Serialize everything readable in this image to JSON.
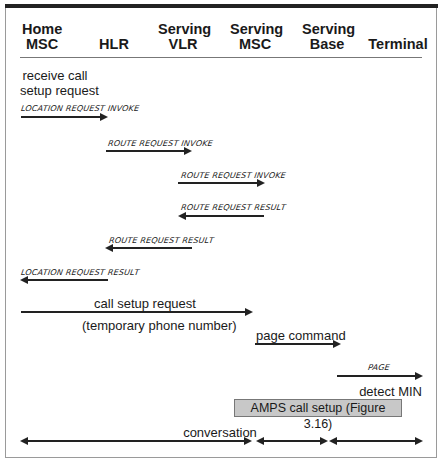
{
  "columns": [
    {
      "name": "home-msc",
      "line1": "Home",
      "line2": "MSC"
    },
    {
      "name": "hlr",
      "line1": "",
      "line2": "HLR"
    },
    {
      "name": "serving-vlr",
      "line1": "Serving",
      "line2": "VLR"
    },
    {
      "name": "serving-msc",
      "line1": "Serving",
      "line2": "MSC"
    },
    {
      "name": "serving-base",
      "line1": "Serving",
      "line2": "Base"
    },
    {
      "name": "terminal",
      "line1": "",
      "line2": "Terminal"
    }
  ],
  "notes": {
    "receive_call_1": "receive call",
    "receive_call_2": "setup request",
    "detect_min": "detect MIN"
  },
  "messages": [
    {
      "label": "LOCATION REQUEST INVOKE",
      "from": "Home MSC",
      "to": "HLR",
      "direction": "right"
    },
    {
      "label": "ROUTE REQUEST INVOKE",
      "from": "HLR",
      "to": "Serving VLR",
      "direction": "right"
    },
    {
      "label": "ROUTE REQUEST INVOKE",
      "from": "Serving VLR",
      "to": "Serving MSC",
      "direction": "right"
    },
    {
      "label": "ROUTE REQUEST RESULT",
      "from": "Serving MSC",
      "to": "Serving VLR",
      "direction": "left"
    },
    {
      "label": "ROUTE REQUEST RESULT",
      "from": "Serving VLR",
      "to": "HLR",
      "direction": "left"
    },
    {
      "label": "LOCATION REQUEST RESULT",
      "from": "HLR",
      "to": "Home MSC",
      "direction": "left"
    },
    {
      "label": "call setup request",
      "sublabel": "(temporary phone number)",
      "from": "Home MSC",
      "to": "Serving MSC",
      "direction": "right"
    },
    {
      "label": "page command",
      "from": "Serving MSC",
      "to": "Serving Base",
      "direction": "right"
    },
    {
      "label": "PAGE",
      "from": "Serving Base",
      "to": "Terminal",
      "direction": "right"
    }
  ],
  "box": {
    "label": "AMPS call setup (Figure 3.16)"
  },
  "conversation": {
    "label": "conversation"
  }
}
